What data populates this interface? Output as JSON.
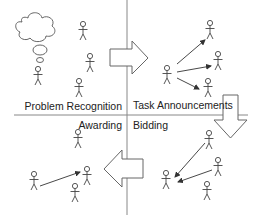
{
  "diagram": {
    "type": "contract-net protocol quadrant diagram",
    "quadrants": {
      "top_left": {
        "label": "Problem Recognition"
      },
      "top_right": {
        "label": "Task Announcements"
      },
      "bottom_left": {
        "label": "Awarding"
      },
      "bottom_right": {
        "label": "Bidding"
      }
    },
    "colors": {
      "line": "#777777",
      "figure": "#444444",
      "arrow_fill": "#ffffff",
      "text": "#222222"
    },
    "phase_arrows": [
      {
        "name": "recognition-to-announcement",
        "direction": "right"
      },
      {
        "name": "announcement-to-bidding",
        "direction": "down"
      },
      {
        "name": "bidding-to-awarding",
        "direction": "left"
      }
    ]
  }
}
